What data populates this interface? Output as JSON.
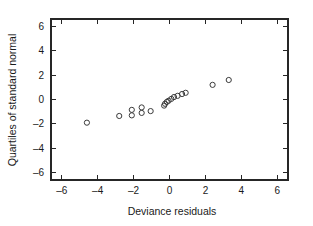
{
  "chart_data": {
    "type": "scatter",
    "title": "",
    "xlabel": "Deviance residuals",
    "ylabel": "Quartiles of standard normal",
    "xlim": [
      -6.6,
      6.6
    ],
    "ylim": [
      -6.6,
      6.6
    ],
    "xticks": [
      -6,
      -4,
      -2,
      0,
      2,
      4,
      6
    ],
    "yticks": [
      -6,
      -4,
      -2,
      0,
      2,
      4,
      6
    ],
    "xtick_labels": [
      "-6",
      "-4",
      "-2",
      "0",
      "2",
      "4",
      "6"
    ],
    "ytick_labels": [
      "-6",
      "-4",
      "-2",
      "0",
      "2",
      "4",
      "6"
    ],
    "grid": false,
    "legend": false,
    "marker": "open-circle",
    "marker_color": "#3b3b3b",
    "frame_color": "#262626",
    "background": "#ffffff",
    "series": [
      {
        "name": "Deviance residuals vs normal quantiles",
        "points": [
          {
            "x": -4.6,
            "y": -1.9
          },
          {
            "x": -2.8,
            "y": -1.35
          },
          {
            "x": -2.1,
            "y": -0.85
          },
          {
            "x": -2.1,
            "y": -1.3
          },
          {
            "x": -1.55,
            "y": -0.65
          },
          {
            "x": -1.55,
            "y": -1.1
          },
          {
            "x": -1.05,
            "y": -0.95
          },
          {
            "x": -0.3,
            "y": -0.5
          },
          {
            "x": -0.25,
            "y": -0.35
          },
          {
            "x": -0.15,
            "y": -0.2
          },
          {
            "x": -0.05,
            "y": -0.1
          },
          {
            "x": 0.1,
            "y": 0.05
          },
          {
            "x": 0.25,
            "y": 0.2
          },
          {
            "x": 0.45,
            "y": 0.3
          },
          {
            "x": 0.7,
            "y": 0.45
          },
          {
            "x": 0.9,
            "y": 0.55
          },
          {
            "x": 2.4,
            "y": 1.2
          },
          {
            "x": 3.3,
            "y": 1.6
          }
        ]
      }
    ]
  }
}
